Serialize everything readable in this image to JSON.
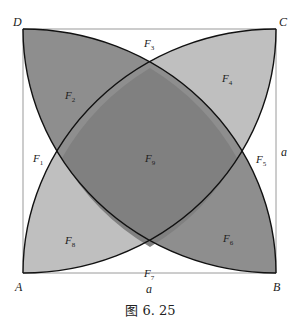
{
  "figure": {
    "caption": "图 6. 25",
    "vertices": {
      "A": "A",
      "B": "B",
      "C": "C",
      "D": "D"
    },
    "side_labels": {
      "bottom": "a",
      "right": "a"
    },
    "regions": [
      {
        "id": "F1",
        "letter": "F",
        "sub": "1"
      },
      {
        "id": "F2",
        "letter": "F",
        "sub": "2"
      },
      {
        "id": "F3",
        "letter": "F",
        "sub": "3"
      },
      {
        "id": "F4",
        "letter": "F",
        "sub": "4"
      },
      {
        "id": "F5",
        "letter": "F",
        "sub": "5"
      },
      {
        "id": "F6",
        "letter": "F",
        "sub": "6"
      },
      {
        "id": "F7",
        "letter": "F",
        "sub": "7"
      },
      {
        "id": "F8",
        "letter": "F",
        "sub": "8"
      },
      {
        "id": "F9",
        "letter": "F",
        "sub": "9"
      }
    ],
    "colors": {
      "dark_lens": "#8f8f8f",
      "light_lens": "#bdbdbd",
      "overlap": "#7a7a7a",
      "square_stroke": "#999999",
      "arc_stroke": "#111111"
    }
  }
}
